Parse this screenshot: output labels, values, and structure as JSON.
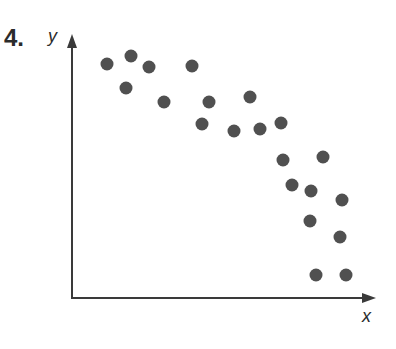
{
  "problem": {
    "number": "4."
  },
  "axes": {
    "x_label": "x",
    "y_label": "y"
  },
  "colors": {
    "dot": "#505050",
    "axis": "#3a3a3a"
  },
  "chart_data": {
    "type": "scatter",
    "title": "4.",
    "xlabel": "x",
    "ylabel": "y",
    "grid": false,
    "legend": null,
    "tick_labels": false,
    "note": "Unlabeled axes; coordinates are estimated pixel positions relative to origin (x right, y up). Negative correlation.",
    "xlim": [
      0,
      300
    ],
    "ylim": [
      0,
      260
    ],
    "points": [
      {
        "x": 35,
        "y": 234
      },
      {
        "x": 59,
        "y": 242
      },
      {
        "x": 77,
        "y": 231
      },
      {
        "x": 54,
        "y": 210
      },
      {
        "x": 92,
        "y": 196
      },
      {
        "x": 120,
        "y": 232
      },
      {
        "x": 137,
        "y": 196
      },
      {
        "x": 178,
        "y": 201
      },
      {
        "x": 130,
        "y": 174
      },
      {
        "x": 162,
        "y": 167
      },
      {
        "x": 188,
        "y": 169
      },
      {
        "x": 209,
        "y": 175
      },
      {
        "x": 211,
        "y": 138
      },
      {
        "x": 251,
        "y": 141
      },
      {
        "x": 220,
        "y": 113
      },
      {
        "x": 239,
        "y": 107
      },
      {
        "x": 270,
        "y": 98
      },
      {
        "x": 238,
        "y": 77
      },
      {
        "x": 268,
        "y": 61
      },
      {
        "x": 244,
        "y": 23
      },
      {
        "x": 274,
        "y": 23
      }
    ]
  }
}
